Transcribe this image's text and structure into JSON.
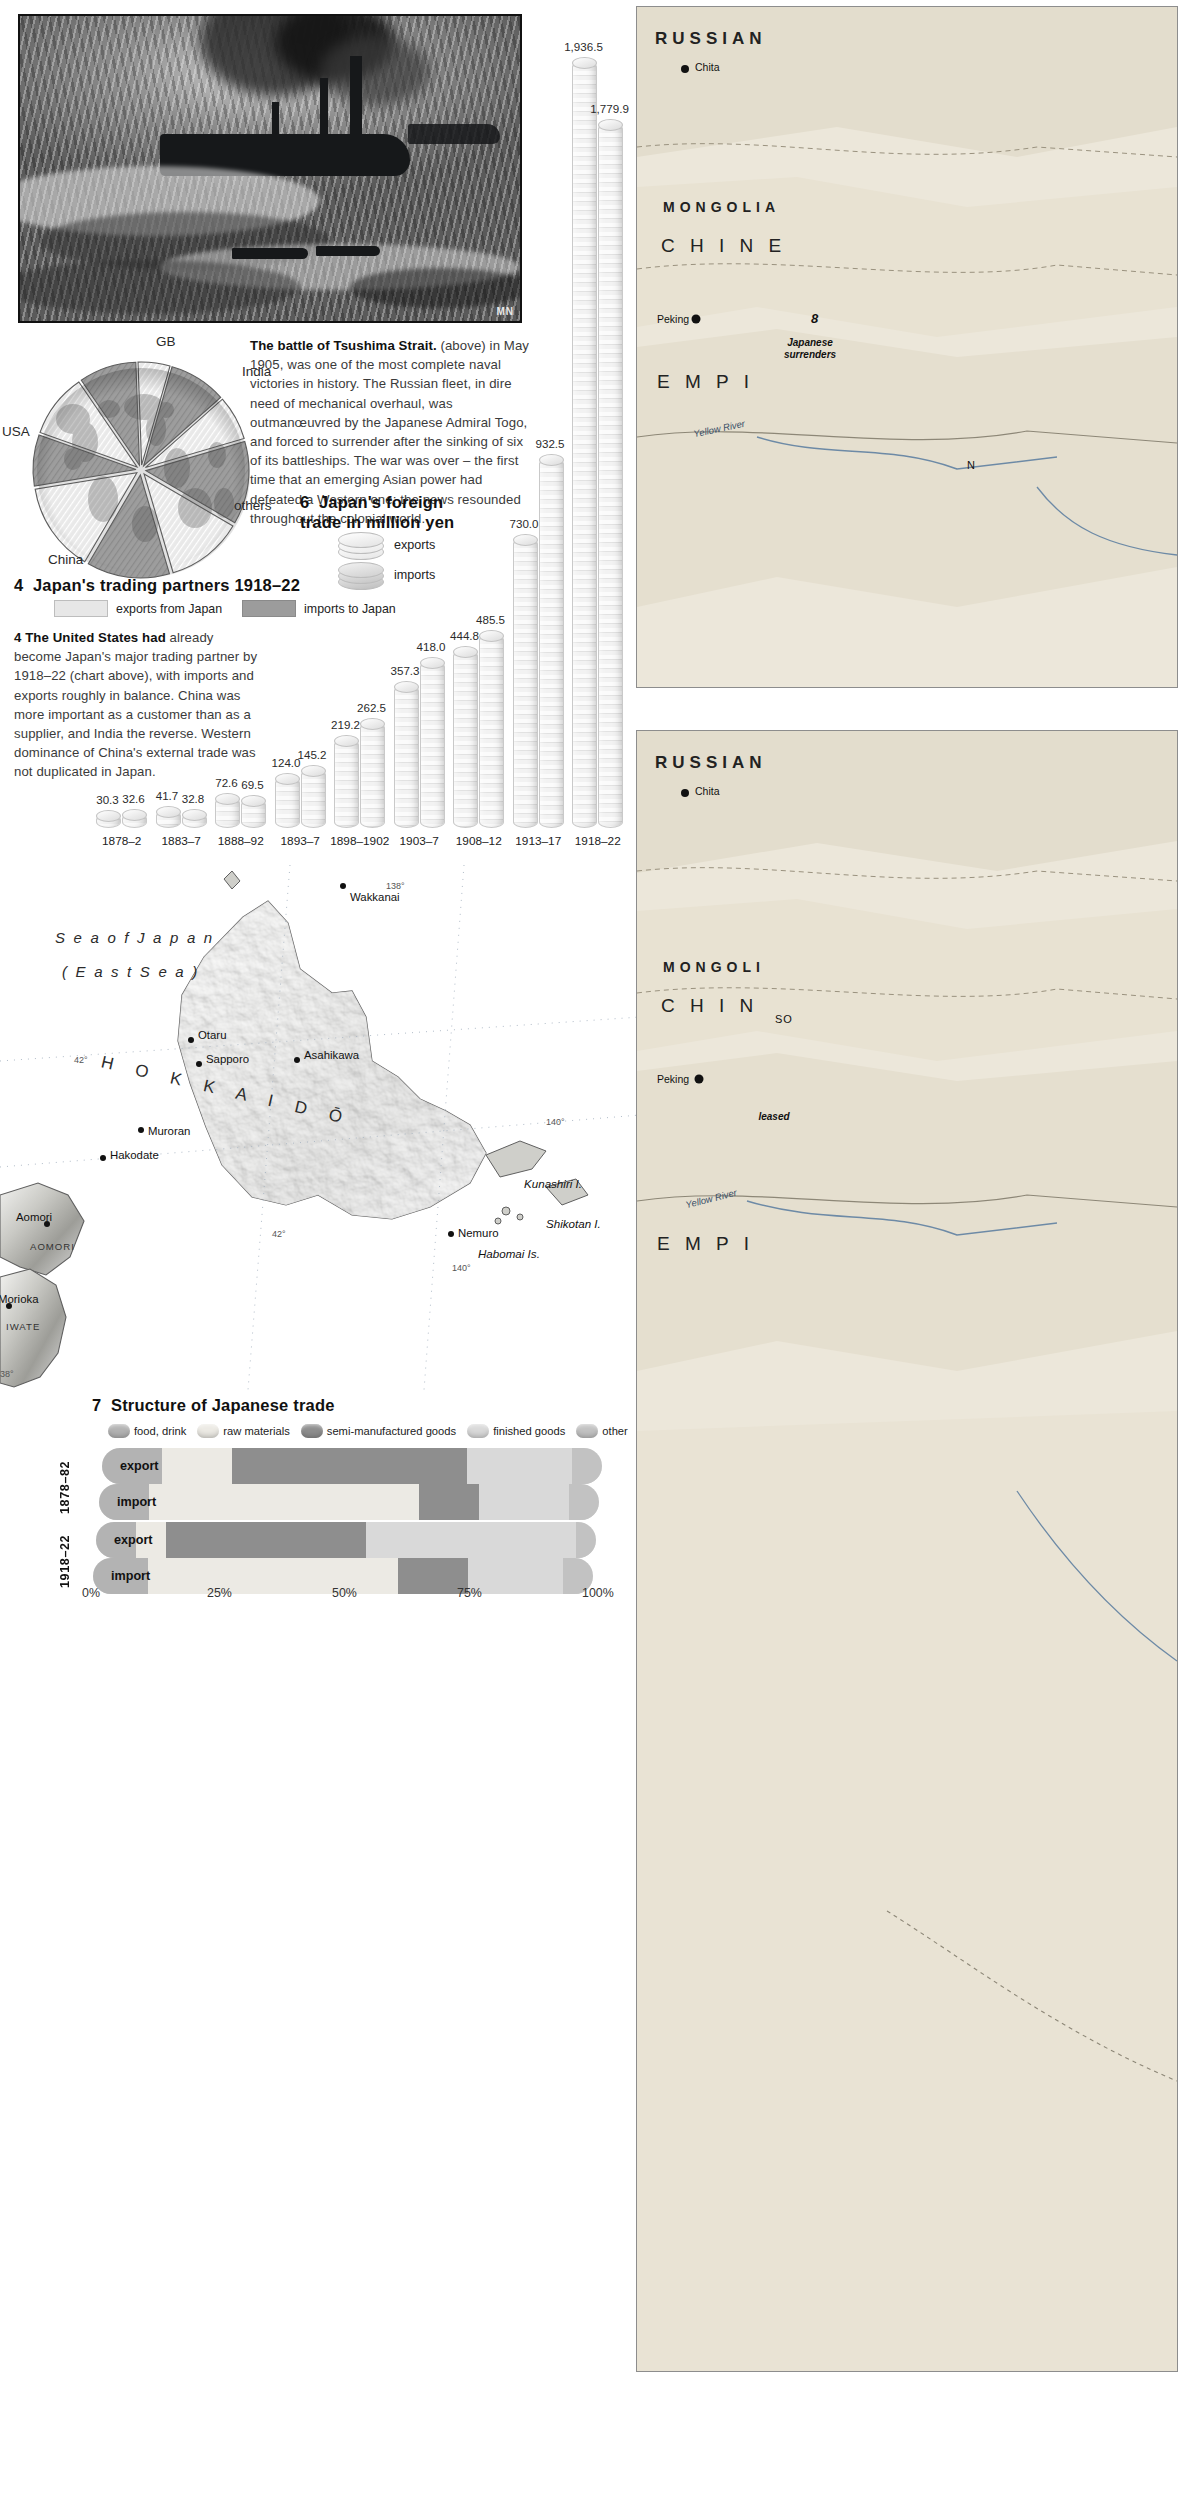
{
  "photo": {
    "alt": "battle-of-tsushima-engraving"
  },
  "tsushima_caption": {
    "lead": "The battle of Tsushima Strait.",
    "body": "(above) in May 1905, was one of the most complete naval victories in history. The Russian fleet, in dire need of mechanical overhaul, was outmanœuvred by the Japanese Admiral Togo, and forced to surrender after the sinking of six of its battleships. The war was over – the first time that an emerging Asian power had defeated a Western one; the news resounded throughout the colonial world."
  },
  "figure4": {
    "number": "4",
    "title": "Japan's trading partners 1918–22",
    "legend": [
      {
        "label": "exports from Japan",
        "color": "#e3e3e3"
      },
      {
        "label": "imports to Japan",
        "color": "#9a9a9a"
      }
    ],
    "caption_lead": "4 The United States had",
    "caption_body": "already become Japan's major trading partner by 1918–22 (chart above), with imports and exports roughly in balance. China was more important as a customer than as a supplier, and India the reverse. Western dominance of China's external trade was not duplicated in Japan."
  },
  "figure6": {
    "number": "6",
    "title_line1": "Japan's foreign",
    "title_line2": "trade in million yen",
    "legend": [
      {
        "label": "exports"
      },
      {
        "label": "imports"
      }
    ],
    "caption_lead": "6 Japanese trade grew",
    "caption_body": "dramatically between 1878 and 1922 (chart above). The growth of imports and exports is shown in million yen. The yen was first issued in 1871 at parity with the dollar but declined steadily until 1894, when the exchange rate stabilized at 2 yen to the dollar, where it remained, with small variations, until 1931."
  },
  "figure7": {
    "number": "7",
    "title": "Structure of Japanese trade",
    "legend": [
      {
        "label": "food, drink",
        "color": "#b3b3b3"
      },
      {
        "label": "raw materials",
        "color": "#eceae4"
      },
      {
        "label": "semi-manufactured goods",
        "color": "#8e8e8e"
      },
      {
        "label": "finished goods",
        "color": "#d9d9d9"
      },
      {
        "label": "other",
        "color": "#c2c2c2"
      }
    ],
    "rows": [
      {
        "period": "1878–82",
        "kind": "export"
      },
      {
        "period": "1878–82",
        "kind": "import"
      },
      {
        "period": "1918–22",
        "kind": "export"
      },
      {
        "period": "1918–22",
        "kind": "import"
      }
    ],
    "axis": [
      "0%",
      "25%",
      "50%",
      "75%",
      "100%"
    ],
    "caption_lead": "7 The structure of",
    "caption_body": "(chart left) changed 1918–22. In the ear represented half of of exports. Within 4 manufactures now a of sales and only 15"
  },
  "map_japan": {
    "sea_label_line1": "S e a   o f   J a p a n",
    "sea_label_line2": "( E a s t   S e a )",
    "island_name": "H O K K A I D Ō",
    "towns": [
      "Wakkanai",
      "Otaru",
      "Sapporo",
      "Asahikawa",
      "Muroran",
      "Hakodate",
      "Nemuro",
      "Aomori",
      "Morioka"
    ],
    "prefectures": [
      "AOMORI",
      "IWATE"
    ],
    "islands": [
      "Kunashiri I.",
      "Shikotan I.",
      "Habomai Is."
    ],
    "coords": [
      "138°",
      "140°",
      "140°",
      "42°",
      "42°",
      "38°"
    ]
  },
  "right_map_top": {
    "countries": [
      "RUSSIAN",
      "MONGOLIA",
      "C H I N E",
      "E M P I"
    ],
    "towns": [
      "Chita",
      "Peking"
    ],
    "rivers": [
      "Yellow River"
    ],
    "notes": [
      "Japanese",
      "surrenders"
    ],
    "misc": [
      "N",
      "8"
    ]
  },
  "right_map_bottom": {
    "countries": [
      "RUSSIAN",
      "MONGOLI",
      "C H I N",
      "E M P I"
    ],
    "towns": [
      "Chita",
      "Peking"
    ],
    "rivers": [
      "Yellow River"
    ],
    "notes": [
      "leased",
      "SO"
    ]
  },
  "chart_data": [
    {
      "type": "pie",
      "title": "Japan's trading partners 1918–22",
      "labels": [
        "GB",
        "India",
        "others",
        "China",
        "USA"
      ],
      "segment_order": [
        "GB-export",
        "GB-import",
        "India-export",
        "India-import",
        "others-export",
        "others-import",
        "China-export",
        "China-import",
        "USA-export",
        "USA-import"
      ],
      "slices": [
        {
          "label": "GB",
          "series": "exports from Japan",
          "percent": 5
        },
        {
          "label": "GB",
          "series": "imports to Japan",
          "percent": 9
        },
        {
          "label": "India",
          "series": "exports from Japan",
          "percent": 7
        },
        {
          "label": "India",
          "series": "imports to Japan",
          "percent": 13
        },
        {
          "label": "others",
          "series": "exports from Japan",
          "percent": 12
        },
        {
          "label": "others",
          "series": "imports to Japan",
          "percent": 13
        },
        {
          "label": "China",
          "series": "exports from Japan",
          "percent": 14
        },
        {
          "label": "China",
          "series": "imports to Japan",
          "percent": 8
        },
        {
          "label": "USA",
          "series": "exports from Japan",
          "percent": 10
        },
        {
          "label": "USA",
          "series": "imports to Japan",
          "percent": 9
        }
      ],
      "legend": [
        "exports from Japan",
        "imports to Japan"
      ],
      "legend_position": "below"
    },
    {
      "type": "bar",
      "title": "Japan's foreign trade in million yen",
      "ylabel": "million yen",
      "xlabel": "",
      "ylim": [
        0,
        2000
      ],
      "grid": false,
      "legend": [
        "exports",
        "imports"
      ],
      "categories": [
        "1878–2",
        "1883–7",
        "1888–92",
        "1893–7",
        "1898–1902",
        "1903–7",
        "1908–12",
        "1913–17",
        "1918–22"
      ],
      "series": [
        {
          "name": "exports",
          "values": [
            30.3,
            41.7,
            72.6,
            124.0,
            219.2,
            357.3,
            444.8,
            730.0,
            1936.5
          ]
        },
        {
          "name": "imports",
          "values": [
            32.6,
            32.8,
            69.5,
            145.2,
            262.5,
            418.0,
            485.5,
            932.5,
            1779.9
          ]
        }
      ],
      "value_labels": [
        "30.3",
        "32.6",
        "41.7",
        "32.8",
        "72.6",
        "69.5",
        "124.0",
        "145.2",
        "219.2",
        "262.5",
        "357.3",
        "418.0",
        "444.8",
        "485.5",
        "730.0",
        "932.5",
        "1,936.5",
        "1,779.9"
      ]
    },
    {
      "type": "bar",
      "orientation": "horizontal",
      "stacked": true,
      "title": "Structure of Japanese trade",
      "categories": [
        "1878–82 export",
        "1878–82 import",
        "1918–22 export",
        "1918–22 import"
      ],
      "xlabel": "percent",
      "xlim": [
        0,
        100
      ],
      "axis_ticks": [
        0,
        25,
        50,
        75,
        100
      ],
      "series": [
        {
          "name": "food, drink",
          "values": [
            12,
            10,
            8,
            11
          ]
        },
        {
          "name": "raw materials",
          "values": [
            14,
            54,
            6,
            50
          ]
        },
        {
          "name": "semi-manufactured goods",
          "values": [
            47,
            12,
            40,
            14
          ]
        },
        {
          "name": "finished goods",
          "values": [
            21,
            18,
            42,
            19
          ]
        },
        {
          "name": "other",
          "values": [
            6,
            6,
            4,
            6
          ]
        }
      ]
    }
  ]
}
